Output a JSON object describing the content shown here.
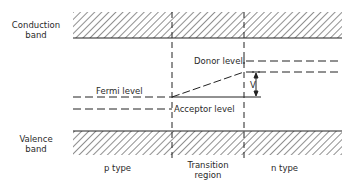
{
  "diagram": {
    "labels": {
      "conduction_band_line1": "Conduction",
      "conduction_band_line2": "band",
      "valence_band_line1": "Valence",
      "valence_band_line2": "band",
      "donor_level": "Donor  level",
      "fermi_level": "Fermi  level",
      "acceptor_level": "Acceptor  level",
      "voltage": "V",
      "p_type": "p  type",
      "transition_line1": "Transition",
      "transition_line2": "region",
      "n_type": "n  type"
    },
    "colors": {
      "line": "#222222",
      "background": "#ffffff"
    }
  }
}
